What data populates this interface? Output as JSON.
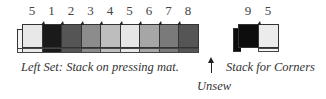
{
  "left_set": {
    "labels": [
      "5",
      "1",
      "2",
      "3",
      "4",
      "5",
      "6",
      "7",
      "8"
    ],
    "colors": [
      "#e8e8e8",
      "#1a1a1a",
      "#555555",
      "#8c8c8c",
      "#bdbdbd",
      "#e6e6e6",
      "#a6a6a6",
      "#7a7a7a",
      "#555555"
    ],
    "caption": "Left Set: Stack on pressing mat."
  },
  "right_set": {
    "labels": [
      "9",
      "5"
    ],
    "colors": [
      "#0d0d0d",
      "#ececec"
    ],
    "caption": "Stack for Corners"
  },
  "arrow": {
    "icon": "up-arrow-icon",
    "label": "Unsew"
  }
}
